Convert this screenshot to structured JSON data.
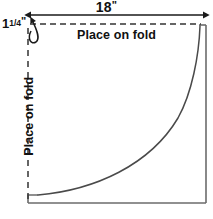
{
  "diagram": {
    "background_color": "#ffffff",
    "line_color": "#4a4a4a",
    "dash_color": "#333333",
    "text_color": "#111111",
    "labels": {
      "width_value": "18",
      "width_unit": "\"",
      "corner_whole": "1",
      "corner_numerator": "1",
      "corner_denominator": "4",
      "corner_unit": "\"",
      "fold_top": "Place on fold",
      "fold_left": "Place on fold"
    },
    "icons": {
      "dimension_arrow": "double-headed-arrow-icon",
      "corner_pointer": "curved-arrow-icon"
    },
    "geometry": {
      "solid_rect": {
        "left": 28,
        "top": 24,
        "right": 206,
        "bottom": 203
      },
      "dashed_top_y": 24,
      "dashed_left_x": 28,
      "dimension_arrow_y": 15,
      "dimension_arrow_x1": 30,
      "dimension_arrow_x2": 204,
      "curve_start": {
        "x": 34,
        "y": 197
      },
      "curve_end": {
        "x": 202,
        "y": 26
      }
    }
  }
}
